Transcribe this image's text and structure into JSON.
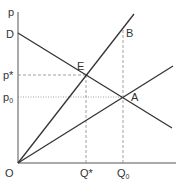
{
  "diagram": {
    "axes": {
      "y_label": "p",
      "x_label": "",
      "origin_label": "O"
    },
    "points": {
      "D": {
        "label": "D"
      },
      "E": {
        "label": "E"
      },
      "A": {
        "label": "A"
      },
      "B": {
        "label": "B"
      }
    },
    "ticks": {
      "p_star": "p*",
      "p_zero_main": "p",
      "p_zero_sub": "0",
      "q_star": "Q*",
      "q_zero_main": "Q",
      "q_zero_sub": "0"
    },
    "lines": [
      {
        "name": "demand-line",
        "from": "D",
        "through": [
          "E",
          "A"
        ]
      },
      {
        "name": "steep-ray",
        "from": "O",
        "through": [
          "E",
          "B"
        ]
      },
      {
        "name": "shallow-ray",
        "from": "O",
        "through": [
          "A"
        ]
      }
    ],
    "colors": {
      "line": "#333333",
      "dashed": "#777777",
      "text": "#333333"
    }
  }
}
